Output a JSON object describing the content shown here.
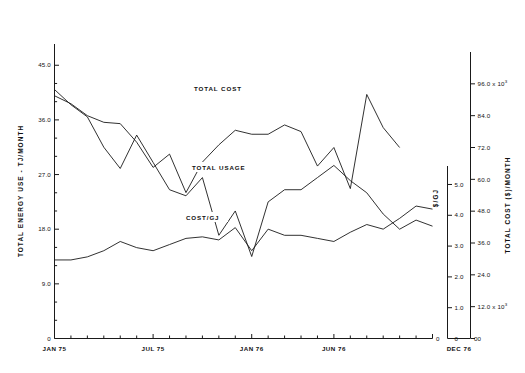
{
  "chart_data": {
    "type": "line",
    "title": "",
    "xlabel": "",
    "grid": false,
    "legend_position": "inline-annotations",
    "x_axis": {
      "tick_labels": [
        "JAN 75",
        "JUL 75",
        "JAN 76",
        "JUN 76",
        "DEC 76"
      ],
      "tick_label_months": [
        0,
        6,
        12,
        17,
        23
      ],
      "minor_ticks": "monthly",
      "n_points": 24
    },
    "y_axis_left": {
      "label": "TOTAL ENERGY USE - TJ/MONTH",
      "ticks": [
        "0",
        "9.0",
        "18.0",
        "27.0",
        "36.0",
        "45.0"
      ],
      "tick_values": [
        0,
        9,
        18,
        27,
        36,
        45
      ],
      "range": [
        0,
        48.5
      ]
    },
    "y_axis_right_inner": {
      "label": "$/GJ",
      "ticks": [
        "0",
        "1.0",
        "2.0",
        "3.0",
        "4.0",
        "5.0"
      ],
      "tick_values": [
        0,
        1,
        2,
        3,
        4,
        5
      ],
      "range": [
        0,
        5.6
      ]
    },
    "y_axis_right_outer": {
      "label": "TOTAL COST ($)/MONTH",
      "ticks": [
        "0",
        "12.0 x 10",
        "24.0",
        "36.0",
        "48.0",
        "60.0",
        "72.0",
        "84.0",
        "96.0 x 10"
      ],
      "tick_values": [
        0,
        12000,
        24000,
        36000,
        48000,
        60000,
        72000,
        84000,
        96000
      ],
      "tick_exponent": "3",
      "range": [
        0,
        108000
      ]
    },
    "series": [
      {
        "name": "TOTAL COST",
        "annotation": "TOTAL COST",
        "units": "$/month (x10^3)",
        "axis": "right-outer",
        "values": [
          91.5,
          88.5,
          84.0,
          81.5,
          81.0,
          74.0,
          64.5,
          69.5,
          55.0,
          66.5,
          73.0,
          78.5,
          77.0,
          77.0,
          80.5,
          78.0,
          65.0,
          72.0,
          56.5,
          92.0,
          79.5,
          72.0
        ]
      },
      {
        "name": "TOTAL USAGE",
        "annotation": "TOTAL USAGE",
        "units": "TJ/month",
        "axis": "left",
        "values": [
          41.0,
          38.5,
          36.5,
          31.5,
          28.0,
          33.5,
          29.0,
          24.5,
          23.5,
          26.5,
          17.0,
          21.0,
          13.5,
          22.5,
          24.5,
          24.5,
          26.5,
          28.5,
          26.0,
          24.0,
          20.5,
          18.0,
          19.5,
          18.5
        ]
      },
      {
        "name": "COST/GJ",
        "annotation": "COST/GJ",
        "units": "$/GJ",
        "axis": "right-inner",
        "values": [
          2.55,
          2.55,
          2.65,
          2.85,
          3.15,
          2.95,
          2.85,
          3.05,
          3.25,
          3.3,
          3.2,
          3.6,
          2.85,
          3.55,
          3.35,
          3.35,
          3.25,
          3.15,
          3.45,
          3.7,
          3.55,
          3.9,
          4.3,
          4.2
        ]
      }
    ],
    "annotations": [
      {
        "text": "TOTAL COST",
        "x_month": 9.2,
        "y_px": 90
      },
      {
        "text": "TOTAL USAGE",
        "x_month": 9.2,
        "y_px": 169
      },
      {
        "text": "COST/GJ",
        "x_month": 8.6,
        "y_px": 219
      }
    ]
  }
}
